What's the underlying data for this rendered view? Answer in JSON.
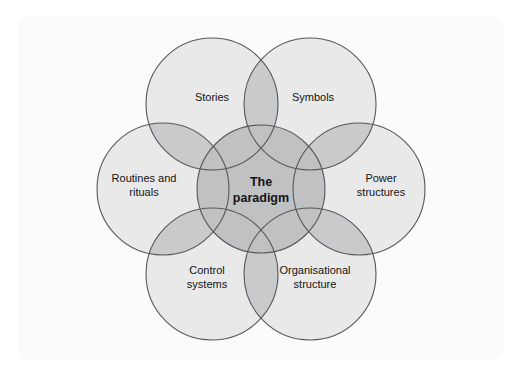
{
  "figure": {
    "kind": "cultural-web-venn-diagram",
    "background_color": "#ffffff",
    "card_color": "#fbfbfb"
  },
  "colors": {
    "petal_fill": "#e9e9e9",
    "petal_stroke": "#55585c",
    "lens_fill": "#c9cacb",
    "center_fill": "#c0c1c2",
    "center_stroke": "#55585c",
    "text": "#141414"
  },
  "geometry": {
    "center_x": 261,
    "center_y": 189,
    "petal_radius": 66,
    "petal_distance": 98,
    "core_radius": 64,
    "stroke_width": 1.1
  },
  "chart_data": {
    "type": "venn",
    "core": {
      "name": "the-paradigm",
      "lines": [
        "The",
        "paradigm"
      ],
      "text": "The paradigm"
    },
    "petals": [
      {
        "name": "stories",
        "lines": [
          "Stories"
        ],
        "text": "Stories",
        "angle_deg": -120,
        "cx": 212,
        "cy": 104,
        "label_x": 212,
        "label_y": 97
      },
      {
        "name": "symbols",
        "lines": [
          "Symbols"
        ],
        "text": "Symbols",
        "angle_deg": -60,
        "cx": 310,
        "cy": 104,
        "label_x": 313,
        "label_y": 97
      },
      {
        "name": "power-structures",
        "lines": [
          "Power",
          "structures"
        ],
        "text": "Power structures",
        "angle_deg": 0,
        "cx": 359,
        "cy": 189,
        "label_x": 381,
        "label_y": 185
      },
      {
        "name": "organisational-structure",
        "lines": [
          "Organisational",
          "structure"
        ],
        "text": "Organisational structure",
        "angle_deg": 60,
        "cx": 310,
        "cy": 274,
        "label_x": 315,
        "label_y": 277
      },
      {
        "name": "control-systems",
        "lines": [
          "Control",
          "systems"
        ],
        "text": "Control systems",
        "angle_deg": 120,
        "cx": 212,
        "cy": 274,
        "label_x": 207,
        "label_y": 277
      },
      {
        "name": "routines-and-rituals",
        "lines": [
          "Routines and",
          "rituals"
        ],
        "text": "Routines and rituals",
        "angle_deg": 180,
        "cx": 163,
        "cy": 189,
        "label_x": 144,
        "label_y": 185
      }
    ]
  }
}
